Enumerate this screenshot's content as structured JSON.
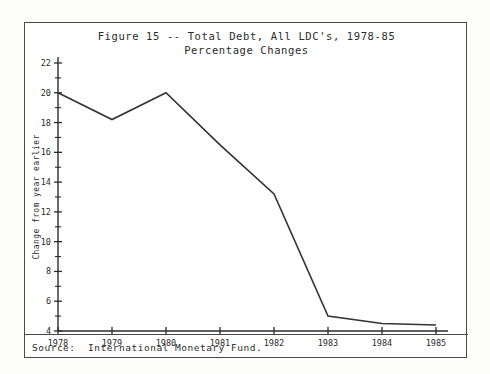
{
  "figure": {
    "title_line1": "Figure 15 -- Total Debt, All LDC's, 1978-85",
    "title_line2": "Percentage Changes",
    "source_note": "Source:  International Monetary Fund."
  },
  "chart_data": {
    "type": "line",
    "xlabel": "",
    "ylabel": "Change from year earlier",
    "x": [
      "1978",
      "1979",
      "1980",
      "1981",
      "1982",
      "1983",
      "1984",
      "1985"
    ],
    "values": [
      20.0,
      18.2,
      20.0,
      16.5,
      13.2,
      5.0,
      4.5,
      4.4
    ],
    "xlim": [
      "1978",
      "1985"
    ],
    "ylim": [
      4,
      22
    ],
    "ytick_labels": [
      "4",
      "6",
      "8",
      "10",
      "12",
      "14",
      "16",
      "18",
      "20",
      "22"
    ],
    "ytick_values": [
      4,
      6,
      8,
      10,
      12,
      14,
      16,
      18,
      20,
      22
    ],
    "yminor_values": [
      5,
      7,
      9,
      11,
      13,
      15,
      17,
      19,
      21
    ],
    "xtick_labels": [
      "1978",
      "1979",
      "1980",
      "1981",
      "1982",
      "1983",
      "1984",
      "1985"
    ],
    "grid": false,
    "legend": null,
    "line_color": "#333333",
    "axis_color": "#2b2b2b"
  }
}
